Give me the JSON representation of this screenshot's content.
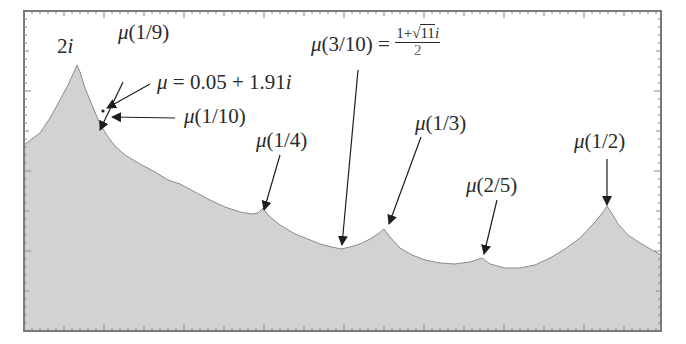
{
  "figure": {
    "frame": {
      "x0": 24,
      "y0": 11,
      "x1": 661,
      "y1": 331,
      "stroke": "#7a7a7a"
    },
    "fill_color": "#d2d2d2",
    "boundary_color": "#8a8a8a",
    "text_color": "#2a2a2a"
  },
  "labels": {
    "peak": {
      "text": "2",
      "italic": "i"
    },
    "mu_1_9": {
      "mu": "μ",
      "arg": "(1/9)"
    },
    "mu_point": {
      "mu": "μ",
      "rest": " = 0.05 + 1.91",
      "italic": "i"
    },
    "mu_1_10": {
      "mu": "μ",
      "arg": "(1/10)"
    },
    "mu_1_4": {
      "mu": "μ",
      "arg": "(1/4)"
    },
    "mu_3_10": {
      "mu": "μ",
      "arg": "(3/10) = ",
      "num_pre": "1+√",
      "num_rad": "11",
      "num_post": "i",
      "den": "2"
    },
    "mu_1_3": {
      "mu": "μ",
      "arg": "(1/3)"
    },
    "mu_2_5": {
      "mu": "μ",
      "arg": "(2/5)"
    },
    "mu_1_2": {
      "mu": "μ",
      "arg": "(1/2)"
    }
  },
  "arrows": [
    {
      "name": "arrow-mu-1-9",
      "x1": 123,
      "y1": 82,
      "x2": 100,
      "y2": 130
    },
    {
      "name": "arrow-mu-point",
      "x1": 150,
      "y1": 84,
      "x2": 107,
      "y2": 108
    },
    {
      "name": "arrow-mu-1-10",
      "x1": 175,
      "y1": 118,
      "x2": 112,
      "y2": 117
    },
    {
      "name": "arrow-mu-1-4",
      "x1": 280,
      "y1": 155,
      "x2": 264,
      "y2": 210
    },
    {
      "name": "arrow-mu-3-10",
      "x1": 358,
      "y1": 70,
      "x2": 342,
      "y2": 245
    },
    {
      "name": "arrow-mu-1-3",
      "x1": 421,
      "y1": 137,
      "x2": 389,
      "y2": 224
    },
    {
      "name": "arrow-mu-2-5",
      "x1": 497,
      "y1": 200,
      "x2": 484,
      "y2": 254
    },
    {
      "name": "arrow-mu-1-2",
      "x1": 607,
      "y1": 159,
      "x2": 607,
      "y2": 205
    }
  ],
  "point": {
    "x": 103,
    "y": 111
  },
  "chart_data": {
    "type": "area",
    "title": "",
    "xlabel": "",
    "ylabel": "",
    "grid": false,
    "annotations": [
      "2i",
      "μ(1/9)",
      "μ = 0.05 + 1.91i",
      "μ(1/10)",
      "μ(1/4)",
      "μ(3/10) = (1+√11 i)/2",
      "μ(1/3)",
      "μ(2/5)",
      "μ(1/2)"
    ],
    "boundary_pixels": [
      [
        24,
        145
      ],
      [
        40,
        133
      ],
      [
        50,
        118
      ],
      [
        60,
        100
      ],
      [
        68,
        85
      ],
      [
        74,
        72
      ],
      [
        77,
        65
      ],
      [
        80,
        72
      ],
      [
        85,
        88
      ],
      [
        92,
        105
      ],
      [
        100,
        124
      ],
      [
        108,
        137
      ],
      [
        115,
        146
      ],
      [
        125,
        155
      ],
      [
        140,
        164
      ],
      [
        155,
        172
      ],
      [
        168,
        180
      ],
      [
        180,
        184
      ],
      [
        195,
        192
      ],
      [
        210,
        200
      ],
      [
        225,
        207
      ],
      [
        240,
        212
      ],
      [
        252,
        214
      ],
      [
        258,
        213
      ],
      [
        263,
        208
      ],
      [
        268,
        215
      ],
      [
        280,
        225
      ],
      [
        295,
        234
      ],
      [
        308,
        239
      ],
      [
        320,
        244
      ],
      [
        332,
        247
      ],
      [
        341,
        249
      ],
      [
        350,
        247
      ],
      [
        360,
        244
      ],
      [
        370,
        239
      ],
      [
        378,
        234
      ],
      [
        384,
        229
      ],
      [
        390,
        237
      ],
      [
        400,
        248
      ],
      [
        412,
        255
      ],
      [
        425,
        260
      ],
      [
        440,
        263
      ],
      [
        455,
        264
      ],
      [
        470,
        262
      ],
      [
        482,
        258
      ],
      [
        490,
        264
      ],
      [
        505,
        268
      ],
      [
        520,
        268
      ],
      [
        535,
        265
      ],
      [
        550,
        258
      ],
      [
        565,
        249
      ],
      [
        580,
        238
      ],
      [
        595,
        222
      ],
      [
        603,
        212
      ],
      [
        607,
        206
      ],
      [
        611,
        212
      ],
      [
        618,
        224
      ],
      [
        628,
        235
      ],
      [
        640,
        243
      ],
      [
        652,
        250
      ],
      [
        661,
        255
      ]
    ]
  }
}
